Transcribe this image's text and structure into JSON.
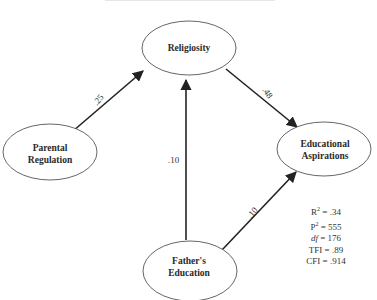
{
  "diagram": {
    "type": "path-model",
    "nodes": [
      {
        "id": "religiosity",
        "label_lines": [
          "Religiosity"
        ]
      },
      {
        "id": "parental_regulation",
        "label_lines": [
          "Parental",
          "Regulation"
        ]
      },
      {
        "id": "educational_aspirations",
        "label_lines": [
          "Educational",
          "Aspirations"
        ]
      },
      {
        "id": "fathers_education",
        "label_lines": [
          "Father's",
          "Education"
        ]
      }
    ],
    "edges": [
      {
        "from": "parental_regulation",
        "to": "religiosity",
        "coefficient": ".25"
      },
      {
        "from": "religiosity",
        "to": "educational_aspirations",
        "coefficient": ".48"
      },
      {
        "from": "fathers_education",
        "to": "religiosity",
        "coefficient": ".10"
      },
      {
        "from": "fathers_education",
        "to": "educational_aspirations",
        "coefficient": ".10"
      }
    ],
    "fit_stats": {
      "r2": {
        "label": "R",
        "sup": "2",
        "value": " = .34"
      },
      "p2": {
        "label": "P",
        "sup": "2",
        "value": " = 555"
      },
      "df": {
        "label": "df",
        "value": " = 176"
      },
      "tfi": {
        "label": "TFI",
        "value": " = .89"
      },
      "cfi": {
        "label": "CFI",
        "value": " = .914"
      }
    }
  },
  "colors": {
    "line": "#222222",
    "node_stroke": "#555555",
    "node_fill": "#ffffff"
  }
}
